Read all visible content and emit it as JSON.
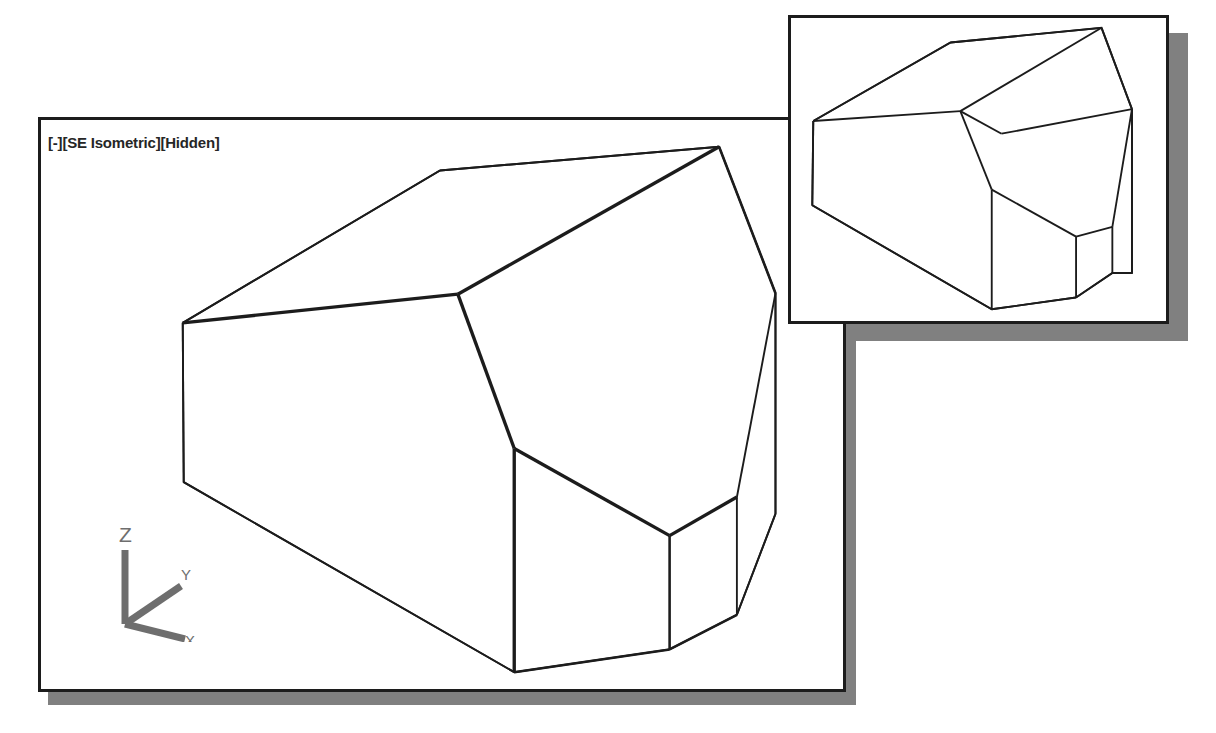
{
  "application": {
    "background_color": "#ffffff",
    "line_color": "#1c1c1c",
    "shadow_color": "#808080"
  },
  "main_viewport": {
    "name": "main-viewport",
    "label": "[-][SE Isometric][Hidden]",
    "label_parts": {
      "viewport_control": "[-]",
      "view_control": "[SE Isometric]",
      "visual_style_control": "[Hidden]"
    },
    "bounds": {
      "x": 38,
      "y": 117,
      "width": 808,
      "height": 575
    },
    "shadow_offset": {
      "x": 10,
      "y": 10
    },
    "ucs_icon": {
      "name": "ucs-icon",
      "axis_labels": {
        "z": "Z",
        "y": "Y",
        "x": "X"
      },
      "color": "#6e6e6e"
    },
    "model": {
      "name": "polyhedral-solid-3d",
      "description": "Hidden-line isometric wireframe of a chamfered polyhedral solid",
      "silhouette": "180,322 440,168 722,144 779,292 779,515 740,617 672,652 515,675 181,483 180,322",
      "edges": [
        "180,322 440,168",
        "440,168 722,144",
        "722,144 779,292",
        "779,292 779,515",
        "779,515 740,617",
        "740,617 672,652",
        "672,652 515,675",
        "515,675 181,483",
        "181,483 180,322",
        "180,322 458,293",
        "458,293 722,144",
        "458,293 515,449",
        "515,449 672,537",
        "672,537 740,498",
        "740,498 779,292",
        "515,449 515,675",
        "672,537 672,652",
        "740,498 740,617"
      ]
    }
  },
  "inset_viewport": {
    "name": "inset-viewport",
    "bounds": {
      "x": 788,
      "y": 15,
      "width": 381,
      "height": 309
    },
    "shadow_offset": {
      "x": 18,
      "y": 18
    },
    "model": {
      "name": "polyhedral-solid-3d-detail",
      "description": "Zoomed detail of the same chamfered polyhedral solid",
      "edges": [
        "810,120 950,40",
        "950,40 1104,25",
        "1104,25 1135,108",
        "1135,108 1135,275",
        "1135,275 1115,275",
        "1115,275 1078,300",
        "1078,300 992,312",
        "992,312 809,206",
        "809,206 810,120",
        "810,120 960,110",
        "960,110 1104,25",
        "960,110 992,190",
        "992,190 1078,238",
        "1078,238 1115,228",
        "1115,228 1135,108",
        "992,190 992,312",
        "1078,238 1078,300",
        "1115,228 1115,275",
        "960,110 1002,133",
        "1002,133 1135,108"
      ]
    }
  }
}
